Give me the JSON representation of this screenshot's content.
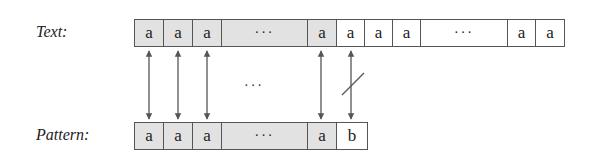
{
  "labels": {
    "text": "Text:",
    "pattern": "Pattern:"
  },
  "text_row": [
    {
      "value": "a",
      "shaded": true,
      "width": 29
    },
    {
      "value": "a",
      "shaded": true,
      "width": 29
    },
    {
      "value": "a",
      "shaded": true,
      "width": 29
    },
    {
      "value": "···",
      "shaded": true,
      "width": 86,
      "ellipsis": true
    },
    {
      "value": "a",
      "shaded": true,
      "width": 29
    },
    {
      "value": "a",
      "shaded": false,
      "width": 28
    },
    {
      "value": "a",
      "shaded": false,
      "width": 28
    },
    {
      "value": "a",
      "shaded": false,
      "width": 28
    },
    {
      "value": "···",
      "shaded": false,
      "width": 87,
      "ellipsis": true
    },
    {
      "value": "a",
      "shaded": false,
      "width": 28
    },
    {
      "value": "a",
      "shaded": false,
      "width": 28
    }
  ],
  "pattern_row": [
    {
      "value": "a",
      "shaded": true,
      "width": 29
    },
    {
      "value": "a",
      "shaded": true,
      "width": 29
    },
    {
      "value": "a",
      "shaded": true,
      "width": 29
    },
    {
      "value": "···",
      "shaded": true,
      "width": 86,
      "ellipsis": true
    },
    {
      "value": "a",
      "shaded": true,
      "width": 29
    },
    {
      "value": "b",
      "shaded": false,
      "width": 30
    }
  ],
  "middle_ellipsis": "···",
  "arrows": [
    {
      "x": 149,
      "match": true
    },
    {
      "x": 178,
      "match": true
    },
    {
      "x": 207,
      "match": true
    },
    {
      "x": 321,
      "match": true
    },
    {
      "x": 351,
      "match": false
    }
  ],
  "colors": {
    "shaded": "#e2e2e2",
    "border": "#555555",
    "arrow": "#555555"
  }
}
